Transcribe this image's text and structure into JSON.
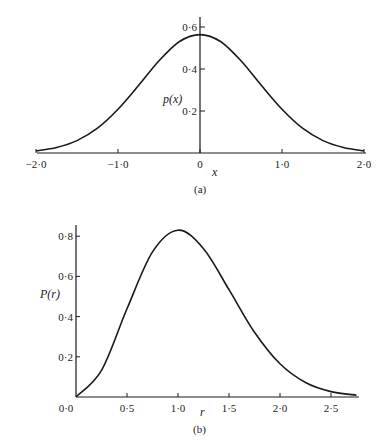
{
  "chart_data": [
    {
      "type": "line",
      "panel": "(a)",
      "caption": "(a)",
      "title": "",
      "xlabel": "x",
      "ylabel": "p(x)",
      "xlim": [
        -2.0,
        2.0
      ],
      "ylim": [
        0,
        0.65
      ],
      "grid": false,
      "legend": null,
      "x_ticks": [
        -2.0,
        -1.0,
        0,
        1.0,
        2.0
      ],
      "x_tick_labels": [
        "−2·0",
        "−1·0",
        "0",
        "1·0",
        "2·0"
      ],
      "y_ticks": [
        0.2,
        0.4,
        0.6
      ],
      "y_tick_labels": [
        "0·2",
        "0·4",
        "0·6"
      ],
      "series": [
        {
          "name": "p(x)",
          "x": [
            -2.0,
            -1.75,
            -1.5,
            -1.25,
            -1.0,
            -0.75,
            -0.5,
            -0.25,
            0.0,
            0.25,
            0.5,
            0.75,
            1.0,
            1.25,
            1.5,
            1.75,
            2.0
          ],
          "values": [
            0.01,
            0.026,
            0.059,
            0.118,
            0.208,
            0.321,
            0.439,
            0.531,
            0.564,
            0.531,
            0.439,
            0.321,
            0.208,
            0.118,
            0.059,
            0.026,
            0.01
          ]
        }
      ]
    },
    {
      "type": "line",
      "panel": "(b)",
      "caption": "(b)",
      "title": "",
      "xlabel": "r",
      "ylabel": "P(r)",
      "xlim": [
        0.0,
        2.75
      ],
      "ylim": [
        0,
        0.85
      ],
      "grid": false,
      "legend": null,
      "x_ticks": [
        0.0,
        0.5,
        1.0,
        1.5,
        2.0,
        2.5
      ],
      "x_tick_labels": [
        "0·0",
        "0·5",
        "1·0",
        "1·5",
        "2·0",
        "2·5"
      ],
      "y_ticks": [
        0.2,
        0.4,
        0.6,
        0.8
      ],
      "y_tick_labels": [
        "0·2",
        "0·4",
        "0·6",
        "0·8"
      ],
      "series": [
        {
          "name": "P(r)",
          "x": [
            0.0,
            0.25,
            0.5,
            0.75,
            1.0,
            1.25,
            1.5,
            1.75,
            2.0,
            2.25,
            2.5,
            2.75
          ],
          "values": [
            0.0,
            0.133,
            0.439,
            0.722,
            0.83,
            0.738,
            0.534,
            0.322,
            0.165,
            0.072,
            0.027,
            0.009
          ]
        }
      ]
    }
  ],
  "panels": {
    "a": {
      "caption": "(a)",
      "ylabel": "p(x)",
      "xlabel": "x"
    },
    "b": {
      "caption": "(b)",
      "ylabel": "P(r)",
      "xlabel": "r"
    }
  },
  "colors": {
    "ink": "#1a1a1a",
    "background": "#ffffff"
  }
}
